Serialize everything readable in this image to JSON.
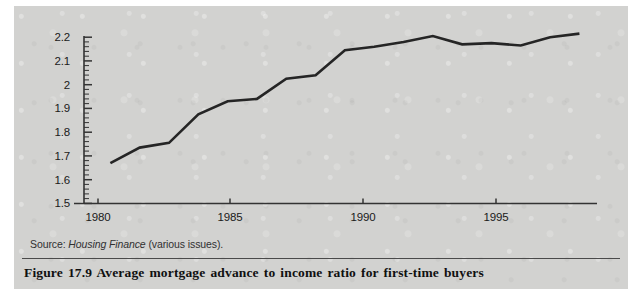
{
  "figure": {
    "caption": "Figure 17.9  Average mortgage advance to income ratio for first-time buyers",
    "source_prefix": "Source: ",
    "source_italic": "Housing Finance",
    "source_suffix": " (various issues)."
  },
  "colors": {
    "panel_background": "#d2d2d0",
    "line": "#252525",
    "axis": "#333333",
    "text": "#1a1a1a"
  },
  "chart_data": {
    "type": "line",
    "title": "Average mortgage advance to income ratio for first-time buyers",
    "xlabel": "",
    "ylabel": "",
    "xlim": [
      1979.1,
      1996.6
    ],
    "ylim": [
      1.5,
      2.25
    ],
    "grid": false,
    "legend": null,
    "y_ticks": [
      1.5,
      1.6,
      1.7,
      1.8,
      1.9,
      2.0,
      2.1,
      2.2
    ],
    "y_tick_labels": [
      "1.5",
      "1.6",
      "1.7",
      "1.8",
      "1.9",
      "2",
      "2.1",
      "2.2"
    ],
    "y_minor_tick_step": 0.02,
    "x_ticks": [
      1980,
      1985,
      1990,
      1995
    ],
    "x_tick_labels": [
      "1980",
      "1985",
      "1990",
      "1995"
    ],
    "series": [
      {
        "name": "Average mortgage advance to income ratio",
        "x": [
          1980,
          1981,
          1982,
          1983,
          1984,
          1985,
          1986,
          1987,
          1988,
          1989,
          1990,
          1991,
          1992,
          1993,
          1994,
          1995,
          1996
        ],
        "values": [
          1.67,
          1.735,
          1.755,
          1.875,
          1.93,
          1.94,
          2.025,
          2.04,
          2.145,
          2.16,
          2.18,
          2.205,
          2.17,
          2.175,
          2.165,
          2.2,
          2.215
        ]
      }
    ]
  }
}
